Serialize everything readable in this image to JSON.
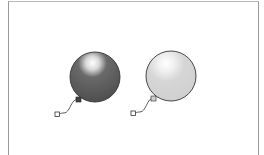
{
  "illustration": {
    "subject": "Two balloons",
    "balloons": [
      {
        "name": "dark-balloon",
        "fill": "#555555",
        "highlight": "#ffffff",
        "outline": "#333333"
      },
      {
        "name": "light-balloon",
        "fill": "#d4d4d4",
        "highlight": "#ffffff",
        "outline": "#333333"
      }
    ],
    "colors": {
      "background": "#ffffff",
      "frame_border": "#9a9a9a",
      "string": "#333333"
    }
  }
}
